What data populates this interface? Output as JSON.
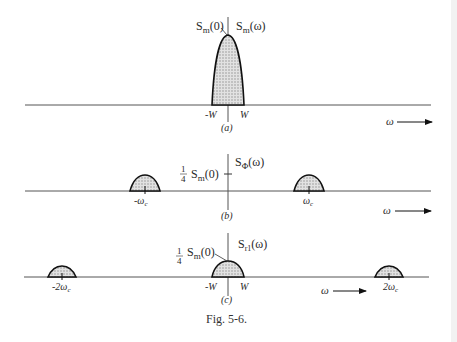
{
  "figure": {
    "caption": "Fig. 5-6.",
    "panels": [
      {
        "id": "a",
        "label": "(a)",
        "function_label": "S_m(ω)",
        "peak_label": "S_m(0)",
        "tick_labels": [
          "-W",
          "W"
        ],
        "axis_variable": "ω",
        "lobes": [
          {
            "center": "0",
            "amplitude": "S_m(0)"
          }
        ]
      },
      {
        "id": "b",
        "label": "(b)",
        "function_label": "S_Φ(ω)",
        "level_label": "1/4 S_m(0)",
        "tick_labels": [
          "-ω_c",
          "ω_c"
        ],
        "axis_variable": "ω",
        "lobes": [
          {
            "center": "-ω_c",
            "amplitude": "1/4 S_m(0)"
          },
          {
            "center": "ω_c",
            "amplitude": "1/4 S_m(0)"
          }
        ]
      },
      {
        "id": "c",
        "label": "(c)",
        "function_label": "S_r1(ω)",
        "peak_label": "1/4 S_m(0)",
        "tick_labels": [
          "-2ω_c",
          "-W",
          "W",
          "2ω_c"
        ],
        "axis_variable": "ω",
        "lobes": [
          {
            "center": "-2ω_c",
            "amplitude": "reduced"
          },
          {
            "center": "0",
            "amplitude": "1/4 S_m(0)"
          },
          {
            "center": "2ω_c",
            "amplitude": "reduced"
          }
        ]
      }
    ]
  },
  "text": {
    "a_S": "S",
    "a_m0_sub": "m",
    "a_m0_rest": "(0)",
    "a_fn_sub": "m",
    "a_fn_rest": "(ω)",
    "a_negW": "-W",
    "a_W": "W",
    "a_panel": "(a)",
    "a_omega": "ω",
    "b_quarter_num": "1",
    "b_quarter_den": "4",
    "b_S": "S",
    "b_m_sub": "m",
    "b_m_rest": "(0)",
    "b_fn_sub": "Φ",
    "b_fn_rest": "(ω)",
    "b_neg_wc": "-ω",
    "b_wc": "ω",
    "b_c_sub": "c",
    "b_panel": "(b)",
    "b_omega": "ω",
    "c_quarter_num": "1",
    "c_quarter_den": "4",
    "c_S": "S",
    "c_m_sub": "m",
    "c_m_rest": "(0)",
    "c_fn_sub": "r1",
    "c_fn_rest": "(ω)",
    "c_neg2wc": "-2ω",
    "c_2wc": "2ω",
    "c_c_sub": "c",
    "c_negW": "-W",
    "c_W": "W",
    "c_panel": "(c)",
    "c_omega": "ω",
    "caption": "Fig. 5-6."
  },
  "colors": {
    "line": "#111111",
    "axis": "#555555",
    "fill": "#c9c9c9",
    "text": "#2a2a2a"
  }
}
